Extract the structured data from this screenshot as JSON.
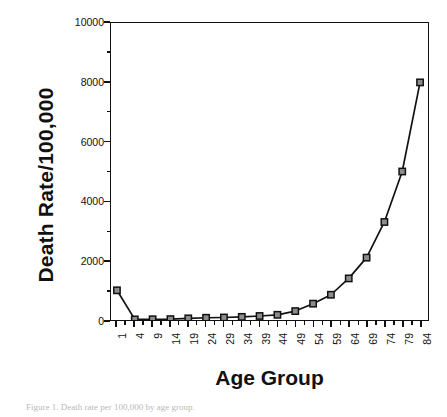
{
  "figure": {
    "caption": "Figure 1.  Death rate per 100,000 by age group."
  },
  "chart_data": {
    "type": "line",
    "title": "",
    "xlabel": "Age Group",
    "ylabel": "Death Rate/100,000",
    "categories": [
      "1",
      "4",
      "9",
      "14",
      "19",
      "24",
      "29",
      "34",
      "39",
      "44",
      "49",
      "54",
      "59",
      "64",
      "69",
      "74",
      "79",
      "84"
    ],
    "values": [
      1000,
      20,
      25,
      30,
      55,
      75,
      85,
      105,
      135,
      175,
      300,
      550,
      850,
      1400,
      2100,
      3300,
      5000,
      8000
    ],
    "series": [
      {
        "name": "Death Rate",
        "values": [
          1000,
          20,
          25,
          30,
          55,
          75,
          85,
          105,
          135,
          175,
          300,
          550,
          850,
          1400,
          2100,
          3300,
          5000,
          8000
        ]
      }
    ],
    "ylim": [
      0,
      10000
    ],
    "ytick_labels": [
      "0",
      "2000",
      "4000",
      "6000",
      "8000",
      "10000"
    ],
    "ytick_values": [
      0,
      2000,
      4000,
      6000,
      8000,
      10000
    ],
    "yminor_values": [
      1000,
      3000,
      5000,
      7000,
      9000
    ],
    "xtick_labels": [
      "1",
      "4",
      "9",
      "14",
      "19",
      "24",
      "29",
      "34",
      "39",
      "44",
      "49",
      "54",
      "59",
      "64",
      "69",
      "74",
      "79",
      "84"
    ],
    "grid": false,
    "legend": false,
    "legend_position": "none",
    "marker": "square",
    "line_color": "#111111",
    "marker_fill": "#8c8c8c",
    "marker_edge": "#111111"
  }
}
